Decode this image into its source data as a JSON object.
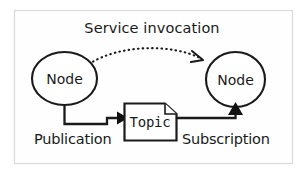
{
  "figure": {
    "type": "ros-publish-subscribe-diagram",
    "title": "Service invocation",
    "background_color": "#ffffff",
    "frame_color": "#d9d9d9",
    "stroke_color": "#1a1a1a"
  },
  "nodes": [
    {
      "id": "node-left",
      "label": "Node",
      "role": "publisher"
    },
    {
      "id": "node-right",
      "label": "Node",
      "role": "subscriber"
    }
  ],
  "topic": {
    "label": "Topic",
    "shape": "document"
  },
  "edges": [
    {
      "id": "edge-publication",
      "label": "Publication",
      "from": "node-left",
      "to": "topic",
      "style": "solid",
      "arrowhead": "filled"
    },
    {
      "id": "edge-subscription",
      "label": "Subscription",
      "from": "topic",
      "to": "node-right",
      "style": "solid",
      "arrowhead": "filled"
    },
    {
      "id": "edge-service-invocation",
      "label": "Service invocation",
      "from": "node-left",
      "to": "node-right",
      "style": "dotted",
      "arrowhead": "open"
    }
  ]
}
